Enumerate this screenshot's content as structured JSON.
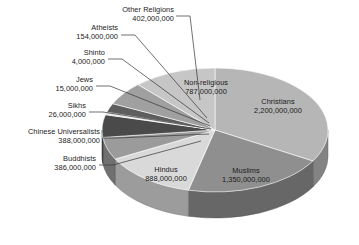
{
  "chart_data": {
    "type": "pie",
    "title": "",
    "subtitle": "",
    "xlabel": "",
    "ylabel": "",
    "legend_position": "none",
    "grid": false,
    "style": "3d-exploded-none",
    "value_format": "comma-separated integers (adherents)",
    "categories": [
      "Christians",
      "Muslims",
      "Hindus",
      "Non-religious",
      "Other Religions",
      "Atheists",
      "Shinto",
      "Jews",
      "Sikhs",
      "Chinese Universalists",
      "Buddhists"
    ],
    "values": [
      2200000000,
      1350000000,
      888000000,
      787000000,
      402000000,
      154000000,
      4000000,
      15000000,
      26000000,
      388000000,
      386000000
    ],
    "value_labels": [
      "2,200,000,000",
      "1,350,000,000",
      "888,000,000",
      "787,000,000",
      "402,000,000",
      "154,000,000",
      "4,000,000",
      "15,000,000",
      "26,000,000",
      "388,000,000",
      "386,000,000"
    ],
    "slice_colors": [
      "#b6b6b6",
      "#8f8f8f",
      "#d9d9d9",
      "#c6c6c6",
      "#a0a0a0",
      "#5e5e5e",
      "#cfcfcf",
      "#7a7a7a",
      "#e2e2e2",
      "#4a4a4a",
      "#9b9b9b"
    ]
  },
  "slices_inside": [
    {
      "name": "Christians",
      "label": "Christians",
      "value": "2,200,000,000"
    },
    {
      "name": "Muslims",
      "label": "Muslims",
      "value": "1,350,000,000"
    },
    {
      "name": "Hindus",
      "label": "Hindus",
      "value": "888,000,000"
    },
    {
      "name": "Non-religious",
      "label": "Non-religious",
      "value": "787,000,000"
    }
  ],
  "slices_callout": [
    {
      "name": "Other Religions",
      "label": "Other Religions",
      "value": "402,000,000"
    },
    {
      "name": "Atheists",
      "label": "Atheists",
      "value": "154,000,000"
    },
    {
      "name": "Shinto",
      "label": "Shinto",
      "value": "4,000,000"
    },
    {
      "name": "Jews",
      "label": "Jews",
      "value": "15,000,000"
    },
    {
      "name": "Sikhs",
      "label": "Sikhs",
      "value": "26,000,000"
    },
    {
      "name": "Chinese Universalists",
      "label": "Chinese Universalists",
      "value": "388,000,000"
    },
    {
      "name": "Buddhists",
      "label": "Buddhists",
      "value": "386,000,000"
    }
  ],
  "canvas": {
    "background_color": "#ffffff",
    "text_color": "#1a1a1a",
    "leader_color": "#333333"
  }
}
